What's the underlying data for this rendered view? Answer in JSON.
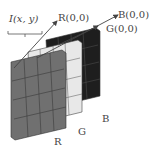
{
  "diagram": {
    "labels": {
      "pixel": "I(x, y)",
      "r_origin": "R(0,0)",
      "b_origin": "B(0,0)",
      "g_origin": "G(0,0)",
      "r_channel": "R",
      "g_channel": "G",
      "b_channel": "B"
    },
    "grid": {
      "rows": 4,
      "cols": 4
    },
    "colors": {
      "r_layer": "#6e6e6e",
      "g_layer": "#e6e6e6",
      "b_layer": "#1e1e1e",
      "grid_line": "#333333",
      "arrow": "#444444",
      "text": "#444444"
    }
  }
}
